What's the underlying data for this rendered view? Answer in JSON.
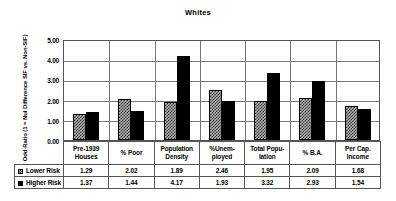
{
  "chart_data": {
    "type": "bar",
    "title": "Whites",
    "xlabel": "",
    "ylabel": "Odd-Ratio (1 = Nul Difference SIF vs. Non-SIF)",
    "ylim": [
      0.0,
      5.0
    ],
    "ytick_labels": [
      "5.00",
      "4.00",
      "3.00",
      "2.00",
      "1.00",
      "0.00"
    ],
    "ytick_values": [
      5.0,
      4.0,
      3.0,
      2.0,
      1.0,
      0.0
    ],
    "grid": "horizontal-and-vertical",
    "legend_position": "table-row-headers",
    "categories": [
      "Pre-1939 Houses",
      "% Poor",
      "Population Density",
      "%Unemployed",
      "Total Population",
      "% B.A.",
      "Per Cap. Income"
    ],
    "category_label_lines": [
      [
        "Pre-1939",
        "Houses"
      ],
      [
        "% Poor",
        ""
      ],
      [
        "Population",
        "Density"
      ],
      [
        "%Unem-",
        "ployed"
      ],
      [
        "Total Popu-",
        "lation"
      ],
      [
        "% B.A.",
        ""
      ],
      [
        "Per Cap.",
        "Income"
      ]
    ],
    "series": [
      {
        "name": "Lower Risk",
        "values": [
          1.29,
          2.02,
          1.89,
          2.46,
          1.95,
          2.09,
          1.68
        ],
        "value_labels": [
          "1.29",
          "2.02",
          "1.89",
          "2.46",
          "1.95",
          "2.09",
          "1.68"
        ],
        "color": "#b4b4b4",
        "pattern": "checkered"
      },
      {
        "name": "Higher Risk",
        "values": [
          1.37,
          1.44,
          4.17,
          1.93,
          3.32,
          2.93,
          1.54
        ],
        "value_labels": [
          "1.37",
          "1.44",
          "4.17",
          "1.93",
          "3.32",
          "2.93",
          "1.54"
        ],
        "color": "#000000",
        "pattern": "solid"
      }
    ]
  },
  "colors": {
    "background": "#ffffff",
    "axis": "#555555",
    "grid": "#777777",
    "lower_risk": "#b4b4b4",
    "higher_risk": "#000000",
    "text": "#000000"
  }
}
